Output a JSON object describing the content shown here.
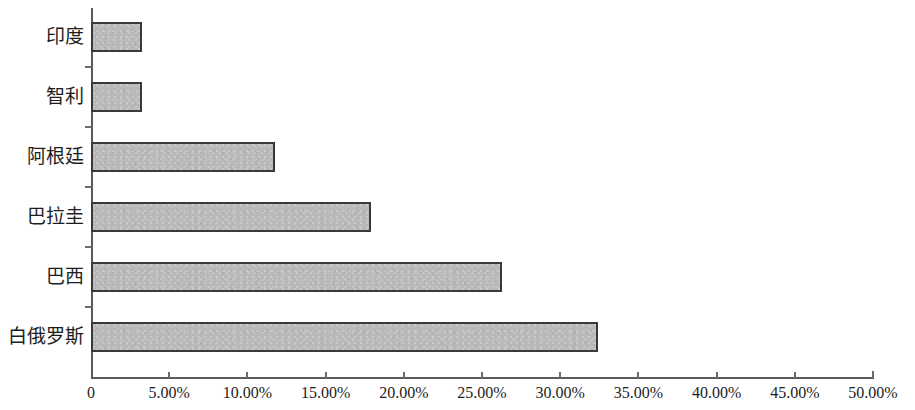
{
  "chart_data": {
    "type": "bar",
    "orientation": "horizontal",
    "title": "",
    "subtitle": "",
    "xlabel": "",
    "ylabel": "",
    "categories": [
      "白俄罗斯",
      "巴西",
      "巴拉圭",
      "阿根廷",
      "智利",
      "印度"
    ],
    "values": [
      32.4,
      26.3,
      17.9,
      11.76,
      3.26,
      3.26
    ],
    "value_labels": [
      "32.40%",
      "26.30%",
      "17.90%",
      "11.76%",
      "3.26%",
      "3.26%"
    ],
    "xlim": [
      0,
      50
    ],
    "xtick_values": [
      0,
      5,
      10,
      15,
      20,
      25,
      30,
      35,
      40,
      45,
      50
    ],
    "xtick_labels": [
      "0",
      "5.00%",
      "10.00%",
      "15.00%",
      "20.00%",
      "25.00%",
      "30.00%",
      "35.00%",
      "40.00%",
      "45.00%",
      "50.00%"
    ],
    "grid": false,
    "legend": null,
    "legend_position": "none",
    "bar_fill_color": "#b9b9b9",
    "bar_border_color": "#3a3a3a",
    "axis_color": "#5a5a5a",
    "text_color": "#1d1d1d",
    "background_color": "#ffffff"
  },
  "axis": {
    "y_categories_top_to_bottom": [
      "印度",
      "智利",
      "阿根廷",
      "巴拉圭",
      "巴西",
      "白俄罗斯"
    ],
    "y_values_top_to_bottom": [
      3.26,
      3.26,
      11.76,
      17.9,
      26.3,
      32.4
    ]
  }
}
